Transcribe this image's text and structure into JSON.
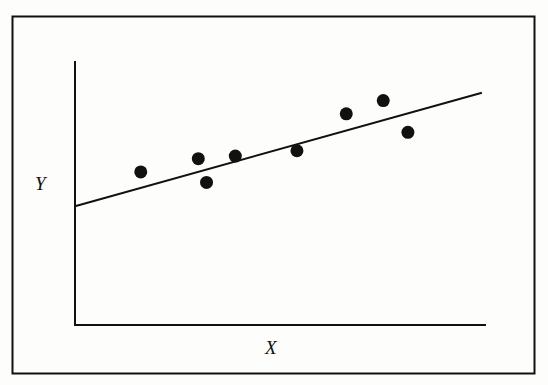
{
  "chart_data": {
    "type": "scatter",
    "title": "",
    "xlabel": "X",
    "ylabel": "Y",
    "grid": false,
    "legend": null,
    "x_ticks": [],
    "y_ticks": [],
    "xlim": [
      0,
      100
    ],
    "ylim": [
      0,
      100
    ],
    "points": [
      {
        "x": 16,
        "y": 58
      },
      {
        "x": 30,
        "y": 63
      },
      {
        "x": 32,
        "y": 54
      },
      {
        "x": 39,
        "y": 64
      },
      {
        "x": 54,
        "y": 66
      },
      {
        "x": 66,
        "y": 80
      },
      {
        "x": 75,
        "y": 85
      },
      {
        "x": 81,
        "y": 73
      }
    ],
    "regression_line": {
      "x0": 0,
      "y0": 45,
      "x1": 99,
      "y1": 88
    },
    "annotations": []
  },
  "labels": {
    "x": "X",
    "y": "Y"
  },
  "colors": {
    "ink": "#111111",
    "background": "#fdfdfb"
  }
}
